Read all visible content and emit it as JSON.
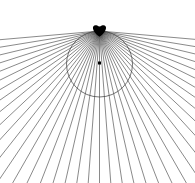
{
  "figure": {
    "type": "geometric-line-diagram",
    "canvas": {
      "width": 195,
      "height": 183,
      "background_color": "#ffffff"
    },
    "colors": {
      "line_color": "#3a3a3a",
      "circle_color": "#3a3a3a",
      "dot_color": "#000000",
      "background": "#ffffff"
    },
    "circle": {
      "center_x": 99.5,
      "center_y": 64,
      "radius": 33,
      "stroke_width": 0.7
    },
    "center_dot": {
      "x": 99.5,
      "y": 63,
      "size": 3
    },
    "pencil_point": {
      "x": 99.5,
      "y": 31,
      "blob_radius": 5
    },
    "rays": {
      "count": 41,
      "angle_start_deg": 5,
      "angle_end_deg": 175,
      "extent": 240,
      "stroke_width": 0.6,
      "origin_x": 99.5,
      "origin_y": 31
    }
  }
}
